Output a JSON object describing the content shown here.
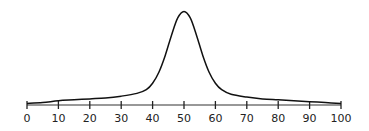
{
  "chart_data": {
    "type": "line",
    "title": "",
    "xlabel": "",
    "ylabel": "",
    "xlim": [
      0,
      100
    ],
    "ylim": [
      0,
      1
    ],
    "grid": false,
    "legend": "none",
    "x_ticks": [
      0,
      10,
      20,
      30,
      40,
      50,
      60,
      70,
      80,
      90,
      100
    ],
    "x_tick_labels": [
      "0",
      "10",
      "20",
      "30",
      "40",
      "50",
      "60",
      "70",
      "80",
      "90",
      "100"
    ],
    "series": [
      {
        "name": "distribution curve",
        "x": [
          0,
          5,
          10,
          15,
          20,
          25,
          30,
          35,
          38,
          40,
          42,
          44,
          46,
          48,
          50,
          52,
          54,
          56,
          58,
          60,
          62,
          65,
          70,
          75,
          80,
          85,
          90,
          95,
          100
        ],
        "y": [
          0.0,
          0.01,
          0.03,
          0.04,
          0.05,
          0.06,
          0.08,
          0.11,
          0.15,
          0.22,
          0.34,
          0.52,
          0.74,
          0.93,
          1.0,
          0.93,
          0.74,
          0.52,
          0.34,
          0.22,
          0.15,
          0.1,
          0.07,
          0.05,
          0.04,
          0.03,
          0.02,
          0.01,
          0.0
        ]
      }
    ]
  }
}
